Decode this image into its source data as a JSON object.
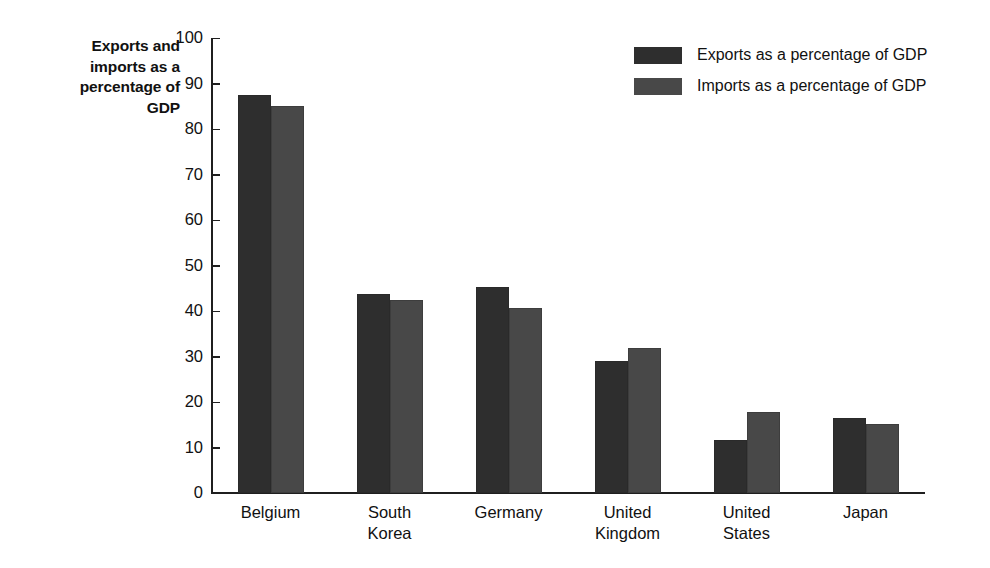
{
  "chart_data": {
    "type": "bar",
    "title": "",
    "ylabel": "Exports and imports as a percentage of GDP",
    "ylabel_lines": [
      "Exports and",
      "imports as a",
      "percentage of",
      "GDP"
    ],
    "xlabel": "",
    "ylim": [
      0,
      100
    ],
    "yticks": [
      0,
      10,
      20,
      30,
      40,
      50,
      60,
      70,
      80,
      90,
      100
    ],
    "ytick_labels": [
      "0",
      "10",
      "20",
      "30",
      "40",
      "50",
      "60",
      "70",
      "80",
      "90",
      "100"
    ],
    "grid": false,
    "legend_position": "top-right",
    "categories": [
      "Belgium",
      "South Korea",
      "Germany",
      "United Kingdom",
      "United States",
      "Japan"
    ],
    "category_label_lines": [
      [
        "Belgium"
      ],
      [
        "South",
        "Korea"
      ],
      [
        "Germany"
      ],
      [
        "United",
        "Kingdom"
      ],
      [
        "United",
        "States"
      ],
      [
        "Japan"
      ]
    ],
    "series": [
      {
        "name": "Exports as a percentage of GDP",
        "color": "#2e2e2e",
        "values": [
          87.5,
          43.7,
          45.3,
          29.0,
          11.6,
          16.4
        ]
      },
      {
        "name": "Imports as a percentage of GDP",
        "color": "#484848",
        "values": [
          85.0,
          42.4,
          40.6,
          31.9,
          17.8,
          15.2
        ]
      }
    ]
  },
  "legend": {
    "items": [
      {
        "label": "Exports as a percentage of GDP",
        "color": "#2e2e2e"
      },
      {
        "label": "Imports as a percentage of GDP",
        "color": "#484848"
      }
    ]
  },
  "colors": {
    "exports": "#2e2e2e",
    "imports": "#484848",
    "axis": "#1f1f1f",
    "text": "#111111",
    "background": "#ffffff"
  }
}
